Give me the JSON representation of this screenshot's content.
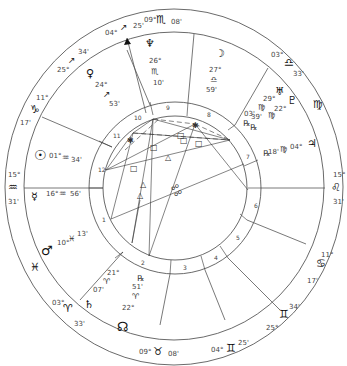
{
  "chart": {
    "ascendant": {
      "deg": "15°",
      "sign_symbol": "♒",
      "min": "31'"
    },
    "descendant": {
      "deg": "15°",
      "sign_symbol": "♌",
      "min": "31'"
    },
    "cusps": [
      {
        "id": "c1",
        "deg": "09°",
        "sign": "♏",
        "min": "08'"
      },
      {
        "id": "c2",
        "deg": "04°",
        "sign": "↗",
        "min": "25'"
      },
      {
        "id": "c3",
        "deg": "25°",
        "sign": "↗",
        "min": "34'"
      },
      {
        "id": "c4",
        "deg": "11°",
        "sign": "♑",
        "min": "17'"
      },
      {
        "id": "c5",
        "deg": "15°",
        "sign": "♒",
        "min": "31'"
      },
      {
        "id": "c6",
        "deg": "03°",
        "sign": "♈",
        "min": "33'"
      },
      {
        "id": "c7",
        "deg": "09°",
        "sign": "♉",
        "min": "08'"
      },
      {
        "id": "c8",
        "deg": "04°",
        "sign": "♊",
        "min": "25'"
      },
      {
        "id": "c9",
        "deg": "25°",
        "sign": "♊",
        "min": "34'"
      },
      {
        "id": "c10",
        "deg": "11°",
        "sign": "♋",
        "min": "17'"
      },
      {
        "id": "c11",
        "deg": "15°",
        "sign": "♌",
        "min": "31'"
      },
      {
        "id": "c12",
        "deg": "03°",
        "sign": "♎",
        "min": "33'"
      }
    ],
    "sign_marks": {
      "pisces": "♓",
      "virgo": "♍"
    },
    "planets": [
      {
        "name": "Neptune",
        "glyph": "♆",
        "deg": "26°",
        "sign": "♏",
        "min": "10'"
      },
      {
        "name": "Moon",
        "glyph": "☽",
        "deg": "27°",
        "sign": "♎",
        "min": "59'"
      },
      {
        "name": "Venus",
        "glyph": "♀",
        "deg": "24°",
        "sign": "↗",
        "min": "53'"
      },
      {
        "name": "Uranus",
        "glyph": "♅",
        "deg": "29°",
        "sign": "♍",
        "min": "39'",
        "retro": "℞"
      },
      {
        "name": "Pluto",
        "glyph": "♇",
        "deg": "22°",
        "sign": "♍",
        "min": "03'",
        "retro": "℞"
      },
      {
        "name": "Jupiter",
        "glyph": "♃",
        "deg": "04°",
        "sign": "♍",
        "min": "18'",
        "retro": "℞"
      },
      {
        "name": "Sun",
        "glyph": "☉",
        "deg": "01°",
        "sign": "♒",
        "min": "34'"
      },
      {
        "name": "Mercury",
        "glyph": "☿",
        "deg": "16°",
        "sign": "♒",
        "min": "56'"
      },
      {
        "name": "Mars",
        "glyph": "♂",
        "deg": "10°",
        "sign": "♓",
        "min": "13'"
      },
      {
        "name": "Saturn",
        "glyph": "♄",
        "deg": "21°",
        "sign": "♈",
        "min": "07'"
      },
      {
        "name": "Node",
        "glyph": "☊",
        "deg": "22°",
        "sign": "♈",
        "min": "51'",
        "retro": "℞"
      }
    ],
    "houses": [
      "1",
      "2",
      "3",
      "4",
      "5",
      "6",
      "7",
      "8",
      "9",
      "10",
      "11",
      "12"
    ],
    "aspect_symbols": {
      "square": "□",
      "trine": "△",
      "sextile": "✱",
      "opposition": "☍"
    }
  }
}
